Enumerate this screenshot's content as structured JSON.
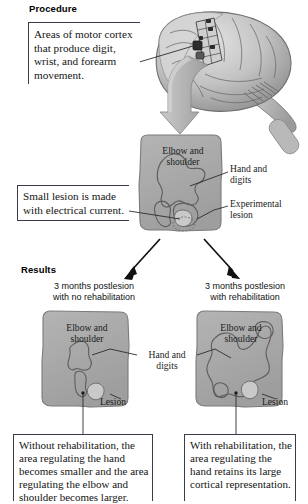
{
  "figure": {
    "accent_color": "#a9a9a9",
    "line_color": "#2b2b35"
  },
  "sections": {
    "procedure": {
      "heading": "Procedure"
    },
    "results": {
      "heading": "Results"
    }
  },
  "callouts": {
    "motor_cortex": {
      "text": "Areas of motor cortex that produce digit, wrist, and forearm movement."
    },
    "small_lesion": {
      "text": "Small lesion is made with electrical current."
    },
    "no_rehabilitation": {
      "text": "Without rehabilitation, the area regulating the hand becomes smaller and the area regulating the elbow and shoulder becomes larger."
    },
    "with_rehabilitation": {
      "text": "With rehabilitation, the area regulating the hand retains its large cortical representation."
    }
  },
  "conditions": {
    "left": {
      "label": "3 months postlesion\nwith no rehabilitation"
    },
    "right": {
      "label": "3 months postlesion\nwith rehabilitation"
    }
  },
  "map_labels": {
    "elbow_shoulder_mid": "Elbow and\nshoulder",
    "hand_digits_mid": "Hand and\ndigits",
    "experimental_lesion": "Experimental\nlesion",
    "elbow_shoulder_left": "Elbow and\nshoulder",
    "elbow_shoulder_right": "Elbow and\nshoulder",
    "hand_digits_results": "Hand and\ndigits",
    "lesion_left": "Lesion",
    "lesion_right": "Lesion"
  },
  "illustration": {
    "brain": "primate-brain-lateral-view-with-electrode-array",
    "arrow_down": "thick-gray-down-arrow",
    "arrow_split_left": "black-arrow-down-left",
    "arrow_split_right": "black-arrow-down-right"
  }
}
